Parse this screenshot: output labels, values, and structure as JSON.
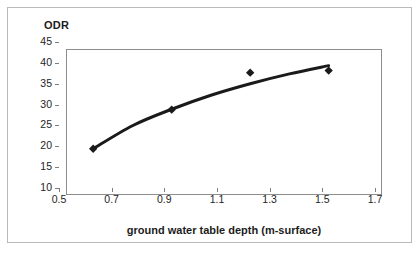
{
  "chart_data": {
    "type": "scatter",
    "title": "",
    "ylabel": "ODR",
    "xlabel": "ground water table depth (m-surface)",
    "xlim": [
      0.5,
      1.7
    ],
    "ylim": [
      10,
      45
    ],
    "xticks": [
      "0.5",
      "0.7",
      "0.9",
      "1.1",
      "1.3",
      "1.5",
      "1.7"
    ],
    "xtick_values": [
      0.5,
      0.7,
      0.9,
      1.1,
      1.3,
      1.5,
      1.7
    ],
    "yticks": [
      "10",
      "15",
      "20",
      "25",
      "30",
      "35",
      "40",
      "45"
    ],
    "ytick_values": [
      10,
      15,
      20,
      25,
      30,
      35,
      40,
      45
    ],
    "grid": false,
    "legend": false,
    "marker": "diamond",
    "marker_color": "#1a1a1a",
    "trendline_color": "#1a1a1a",
    "series": [
      {
        "name": "ODR",
        "x": [
          0.6,
          0.9,
          1.2,
          1.5
        ],
        "values": [
          21,
          30.5,
          39.5,
          40
        ]
      }
    ],
    "trendline": {
      "type": "logarithmic",
      "x": [
        0.6,
        0.75,
        0.9,
        1.05,
        1.2,
        1.35,
        1.5
      ],
      "y": [
        21.0,
        26.6,
        30.6,
        34.0,
        36.8,
        39.2,
        41.2
      ]
    }
  }
}
